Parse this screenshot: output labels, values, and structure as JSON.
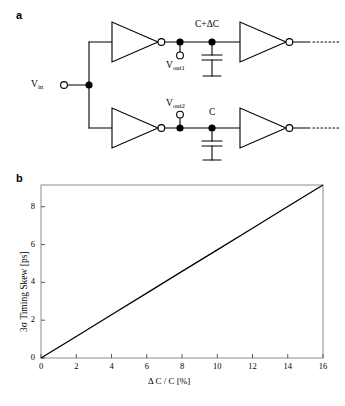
{
  "figure": {
    "panel_a": {
      "label": "a",
      "input_terminal_label": "V",
      "input_terminal_sub": "in",
      "branch_top": {
        "node_label": "V",
        "node_sub": "out1",
        "cap_label": "C+ΔC"
      },
      "branch_bottom": {
        "node_label": "V",
        "node_sub": "out2",
        "cap_label": "C"
      },
      "continuation": "······"
    },
    "panel_b": {
      "label": "b"
    }
  },
  "chart_data": {
    "type": "line",
    "title": "",
    "xlabel": "Δ C / C [%]",
    "ylabel": "3σ Timing Skew [ps]",
    "xlim": [
      0,
      16
    ],
    "ylim": [
      0,
      9.15
    ],
    "xticks": [
      0,
      2,
      4,
      6,
      8,
      10,
      12,
      14,
      16
    ],
    "xtick_labels": [
      "0",
      "2",
      "4",
      "6",
      "8",
      "10",
      "12",
      "14",
      "16"
    ],
    "yticks": [
      0,
      2,
      4,
      6,
      8
    ],
    "ytick_labels": [
      "0",
      "2",
      "4",
      "6",
      "8"
    ],
    "grid": false,
    "legend": "none",
    "series": [
      {
        "name": "3σ timing skew",
        "color": "#000000",
        "x": [
          0,
          2,
          4,
          6,
          8,
          10,
          12,
          14,
          16
        ],
        "y": [
          0.0,
          1.14,
          2.29,
          3.43,
          4.58,
          5.72,
          6.86,
          8.01,
          9.15
        ]
      }
    ]
  }
}
